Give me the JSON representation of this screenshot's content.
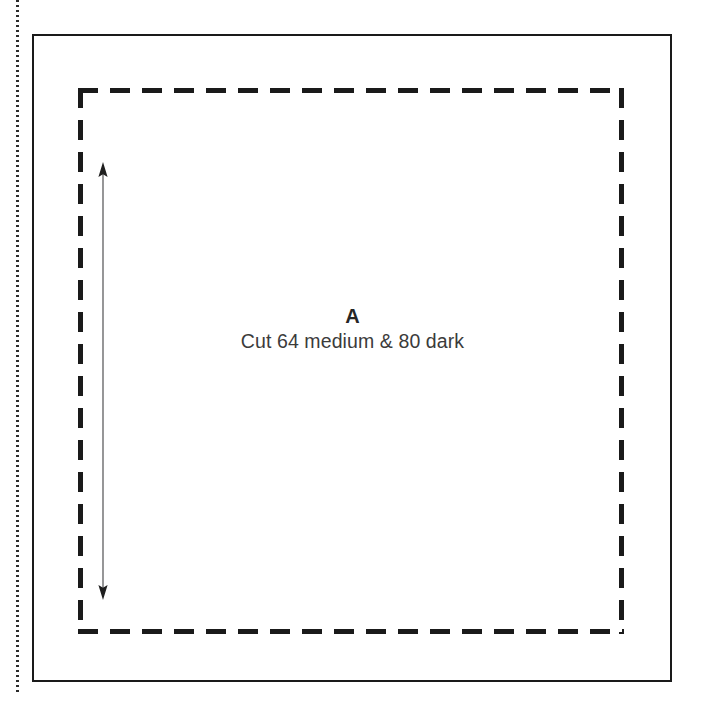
{
  "page": {
    "width": 701,
    "height": 716,
    "background_color": "#ffffff"
  },
  "gutter_rule": {
    "style": "dotted",
    "color": "#2b2b2b",
    "orientation": "vertical"
  },
  "pattern_piece": {
    "letter": "A",
    "instruction": "Cut 64 medium & 80 dark",
    "cut_line": {
      "style": "solid",
      "color": "#1a1a1a",
      "shape": "square"
    },
    "seam_line": {
      "style": "dashed",
      "color": "#1a1a1a",
      "shape": "square",
      "dash_length_px": 20,
      "dash_gap_px": 12
    },
    "measurement_arrow": {
      "style": "double-headed",
      "color": "#58585a",
      "orientation": "vertical"
    }
  }
}
